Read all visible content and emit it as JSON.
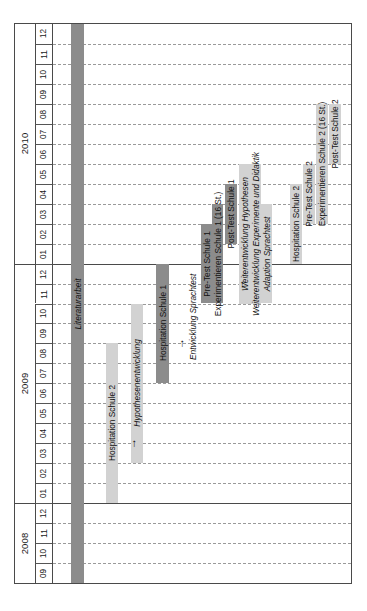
{
  "chart_data": {
    "type": "bar",
    "chart_kind": "gantt",
    "title": "",
    "orientation": "rotated-90-ccw",
    "xlabel": "",
    "ylabel": "",
    "grid": true,
    "legend": "none",
    "time_axis": {
      "unit": "month",
      "start": "2008-09",
      "end": "2010-12",
      "total_months": 28,
      "years": [
        {
          "label": "2008",
          "months": [
            "09",
            "10",
            "11",
            "12"
          ]
        },
        {
          "label": "2009",
          "months": [
            "01",
            "02",
            "03",
            "04",
            "05",
            "06",
            "07",
            "08",
            "09",
            "10",
            "11",
            "12"
          ]
        },
        {
          "label": "2010",
          "months": [
            "01",
            "02",
            "03",
            "04",
            "05",
            "06",
            "07",
            "08",
            "09",
            "10",
            "11",
            "12"
          ]
        }
      ]
    },
    "colors": {
      "bar_dark": "#8c8c8c",
      "bar_light": "#d2d2d2",
      "frame": "#4a4a4a",
      "gridline": "#9a9a9a",
      "background": "#ffffff"
    },
    "tasks": [
      {
        "name": "Literaturarbeit",
        "start": "2008-09",
        "end": "2010-12",
        "shade": "dark",
        "italic": true,
        "label_placement": "inside"
      },
      {
        "name": "Hospitation Schule 2",
        "start": "2009-01",
        "end": "2009-08",
        "shade": "light",
        "italic": false,
        "label_placement": "inside"
      },
      {
        "name": "Hypothesenentwicklung",
        "start": "2009-03",
        "end": "2009-10",
        "shade": "light",
        "italic": true,
        "label_placement": "inside"
      },
      {
        "name": "Hospitation Schule 1",
        "start": "2009-07",
        "end": "2009-12",
        "shade": "dark",
        "italic": false,
        "label_placement": "inside"
      },
      {
        "name": "Entwicklung Sprachtest",
        "start": "2009-08",
        "end": "2009-12",
        "shade": "none",
        "italic": true,
        "label_placement": "outside"
      },
      {
        "name": "Pre-Test Schule 1",
        "start": "2009-11",
        "end": "2010-02",
        "shade": "dark",
        "italic": false,
        "label_placement": "inside"
      },
      {
        "name": "Experimentieren Schule 1 (16 St.)",
        "start": "2009-11",
        "end": "2010-03",
        "shade": "dark",
        "italic": false,
        "label_placement": "inside"
      },
      {
        "name": "Post-Test Schule 1",
        "start": "2010-02",
        "end": "2010-04",
        "shade": "dark",
        "italic": false,
        "label_placement": "inside"
      },
      {
        "name": "Weiterentwicklung Hypothesen",
        "start": "2009-11",
        "end": "2010-05",
        "shade": "light",
        "italic": true,
        "label_placement": "inside"
      },
      {
        "name": "Weiterentwicklung Experimente und Didaktik",
        "start": "2009-11",
        "end": "2010-05",
        "shade": "light",
        "italic": true,
        "label_placement": "inside"
      },
      {
        "name": "Adaption Sprachtest",
        "start": "2009-11",
        "end": "2010-03",
        "shade": "light",
        "italic": true,
        "label_placement": "inside"
      },
      {
        "name": "Hospitation Schule 2",
        "start": "2010-01",
        "end": "2010-04",
        "shade": "light",
        "italic": false,
        "label_placement": "inside"
      },
      {
        "name": "Pre-Test Schule 2",
        "start": "2010-03",
        "end": "2010-05",
        "shade": "light",
        "italic": false,
        "label_placement": "inside"
      },
      {
        "name": "Experimentieren Schule 2 (16 St.)",
        "start": "2010-03",
        "end": "2010-08",
        "shade": "light",
        "italic": false,
        "label_placement": "inside"
      },
      {
        "name": "Post-Test Schule 2",
        "start": "2010-06",
        "end": "2010-08",
        "shade": "light",
        "italic": false,
        "label_placement": "inside"
      },
      {
        "name": "Analyse der Daten",
        "start": "2010-05",
        "end": "2010-12",
        "shade": "dark",
        "italic": true,
        "label_placement": "inside"
      }
    ],
    "annotations": [
      {
        "glyph": "→",
        "near_task": "Hypothesenentwicklung",
        "at_month": "2009-04"
      },
      {
        "glyph": "→",
        "near_task": "Entwicklung Sprachtest",
        "at_month": "2009-09"
      },
      {
        "glyph": "→",
        "near_task": "Weiterentwicklung Hypothesen",
        "at_month": "2009-12"
      }
    ]
  }
}
